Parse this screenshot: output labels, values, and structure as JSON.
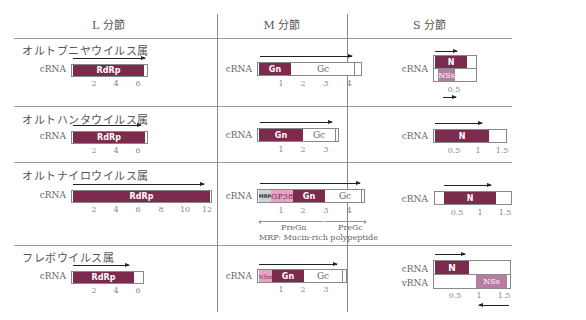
{
  "headers": {
    "l": "L 分節",
    "m": "M 分節",
    "s": "S 分節"
  },
  "rows": [
    {
      "genus": "オルトブニヤウイルス属",
      "l": {
        "label": "cRNA",
        "segments": [
          {
            "name": "RdRp",
            "start": 0,
            "end": 6.3
          }
        ],
        "length": 6.9,
        "ticks": [
          "2",
          "4",
          "6"
        ]
      },
      "m": {
        "label": "cRNA",
        "segments": [
          {
            "name": "Gn",
            "start": 0,
            "end": 1.0
          },
          {
            "name": "Gc",
            "start": 1.0,
            "end": 4.3
          }
        ],
        "length": 4.7,
        "ticks": [
          "1",
          "2",
          "3",
          "4"
        ]
      },
      "s": {
        "label": "cRNA",
        "segments": [
          {
            "name": "N",
            "start": 0,
            "end": 0.7
          },
          {
            "name": "NSs",
            "start": 0.1,
            "end": 0.45
          }
        ],
        "length": 1.0,
        "ticks": [
          "0.5"
        ]
      }
    },
    {
      "genus": "オルトハンタウイルス属",
      "l": {
        "label": "cRNA",
        "segments": [
          {
            "name": "RdRp",
            "start": 0,
            "end": 6.5
          }
        ],
        "length": 6.9,
        "ticks": [
          "2",
          "4",
          "6"
        ]
      },
      "m": {
        "label": "cRNA",
        "segments": [
          {
            "name": "Gn",
            "start": 0,
            "end": 2.0
          },
          {
            "name": "Gc",
            "start": 2.0,
            "end": 3.5
          }
        ],
        "length": 3.7,
        "ticks": [
          "1",
          "2",
          "3"
        ]
      },
      "s": {
        "label": "cRNA",
        "segments": [
          {
            "name": "N",
            "start": 0,
            "end": 1.3
          }
        ],
        "length": 1.75,
        "ticks": [
          "0.5",
          "1",
          "1.5"
        ]
      }
    },
    {
      "genus": "オルトナイロウイルス属",
      "l": {
        "label": "cRNA",
        "segments": [
          {
            "name": "RdRp",
            "start": 0,
            "end": 12.0
          }
        ],
        "length": 12.2,
        "ticks": [
          "2",
          "4",
          "6",
          "8",
          "10",
          "12"
        ]
      },
      "m": {
        "label": "cRNA",
        "segments": [
          {
            "name": "MRP",
            "start": 0,
            "end": 0.4
          },
          {
            "name": "GP38",
            "start": 0.4,
            "end": 1.5
          },
          {
            "name": "Gn",
            "start": 1.5,
            "end": 2.9
          },
          {
            "name": "Gc",
            "start": 3.1,
            "end": 4.6
          }
        ],
        "length": 4.8,
        "ticks": [
          "1",
          "2",
          "3",
          "4"
        ],
        "pre_gn": "PreGn",
        "pre_gc": "PreGc",
        "note": "MRP: Mucin-rich polypeptide"
      },
      "s": {
        "label": "cRNA",
        "segments": [
          {
            "name": "N",
            "start": 0.2,
            "end": 1.45
          }
        ],
        "length": 1.75,
        "ticks": [
          "0.5",
          "1",
          "1.5"
        ]
      }
    },
    {
      "genus": "フレボウイルス属",
      "l": {
        "label": "cRNA",
        "segments": [
          {
            "name": "RdRp",
            "start": 0,
            "end": 5.4
          }
        ],
        "length": 6.4,
        "ticks": [
          "2",
          "4",
          "6"
        ]
      },
      "m": {
        "label": "cRNA",
        "segments": [
          {
            "name": "NSm",
            "start": 0,
            "end": 0.6
          },
          {
            "name": "Gn",
            "start": 0.6,
            "end": 1.9
          },
          {
            "name": "Gc",
            "start": 1.9,
            "end": 3.6
          }
        ],
        "length": 3.9,
        "ticks": [
          "1",
          "2",
          "3"
        ]
      },
      "s": {
        "labels": [
          "cRNA",
          "vRNA"
        ],
        "segments": [
          {
            "name": "N",
            "strand": "cRNA",
            "start": 0,
            "end": 0.8
          },
          {
            "name": "NSs",
            "strand": "vRNA",
            "start": 0.9,
            "end": 1.65
          }
        ],
        "length": 1.75,
        "ticks": [
          "0.5",
          "1",
          "1.5"
        ]
      }
    }
  ],
  "colors": {
    "dark": "#7c2a4e",
    "mid": "#b57ea0",
    "pink": "#e7a3c3",
    "grey": "#cfd1d8"
  }
}
